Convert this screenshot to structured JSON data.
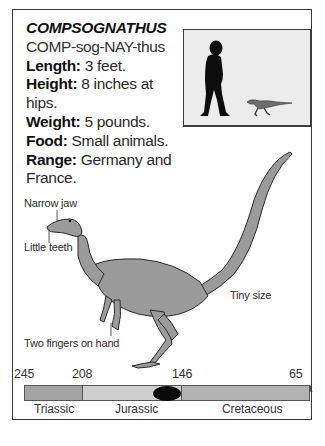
{
  "card": {
    "title": "COMPSOGNATHUS",
    "pronunciation": "COMP-sog-NAY-thus",
    "facts": [
      {
        "label": "Length:",
        "value": " 3 feet."
      },
      {
        "label": "Height:",
        "value": " 8 inches at"
      },
      {
        "label": "",
        "value": "hips."
      },
      {
        "label": "Weight:",
        "value": " 5 pounds."
      },
      {
        "label": "Food:",
        "value": " Small animals."
      },
      {
        "label": "Range:",
        "value": " Germany and"
      },
      {
        "label": "",
        "value": "France."
      }
    ]
  },
  "scale_comparison": {
    "human_icon": "human-silhouette-icon",
    "dino_icon": "compsognathus-small-icon"
  },
  "annotations": {
    "jaw": "Narrow jaw",
    "teeth": "Little teeth",
    "hand": "Two fingers on hand",
    "size": "Tiny size"
  },
  "timeline": {
    "ticks": [
      "245",
      "208",
      "146",
      "65 mya"
    ],
    "periods": [
      {
        "name": "Triassic",
        "color": "#a3a3a3"
      },
      {
        "name": "Jurassic",
        "color": "#cfcfcf"
      },
      {
        "name": "Cretaceous",
        "color": "#b3b3b3"
      }
    ],
    "marker_color": "#0a0a0a"
  }
}
